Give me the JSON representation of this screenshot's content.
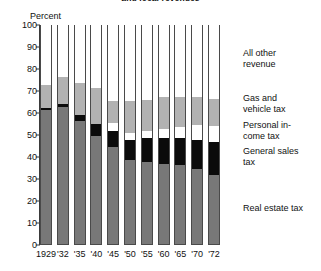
{
  "title_partial": "and local revenues",
  "axis": {
    "ylabel": "Percent",
    "yticks": [
      "100",
      "90",
      "80",
      "70",
      "60",
      "50",
      "40",
      "30",
      "20",
      "10",
      "0"
    ],
    "xticks": [
      "1929",
      "'32",
      "'35",
      "'40",
      "'45",
      "'50",
      "'55",
      "'60",
      "'65",
      "'70",
      "'72"
    ]
  },
  "legend": [
    {
      "key": "other",
      "line1": "All other",
      "line2": "revenue",
      "color": "#ffffff",
      "top": 48
    },
    {
      "key": "gas",
      "line1": "Gas and",
      "line2": "vehicle tax",
      "color": "#b2b2b2",
      "top": 93
    },
    {
      "key": "income",
      "line1": "Personal in-",
      "line2": "come tax",
      "color": "#ffffff",
      "top": 120
    },
    {
      "key": "sales",
      "line1": "General sales",
      "line2": "tax",
      "color": "#0b0b0b",
      "top": 146
    },
    {
      "key": "real",
      "line1": "Real estate tax",
      "line2": "",
      "color": "#787878",
      "top": 203
    }
  ],
  "chart_data": {
    "type": "bar",
    "stacked": true,
    "title": "and local revenues",
    "xlabel": "",
    "ylabel": "Percent",
    "ylim": [
      0,
      100
    ],
    "ytick_step": 10,
    "grid": false,
    "legend_position": "right",
    "categories": [
      "1929",
      "'32",
      "'35",
      "'40",
      "'45",
      "'50",
      "'55",
      "'60",
      "'65",
      "'70",
      "'72"
    ],
    "series": [
      {
        "name": "Real estate tax",
        "color": "#787878",
        "values": [
          61.0,
          62.5,
          56.0,
          49.0,
          44.0,
          38.0,
          37.5,
          36.5,
          36.0,
          34.0,
          31.5
        ]
      },
      {
        "name": "General sales tax",
        "color": "#0b0b0b",
        "values": [
          1.0,
          1.0,
          2.5,
          5.5,
          7.5,
          9.5,
          10.5,
          11.5,
          12.0,
          13.5,
          15.0
        ]
      },
      {
        "name": "Personal income tax",
        "color": "#ffffff",
        "values": [
          0.0,
          0.0,
          0.0,
          0.0,
          3.5,
          3.0,
          3.5,
          4.5,
          5.0,
          6.5,
          7.0
        ]
      },
      {
        "name": "Gas and vehicle tax",
        "color": "#b2b2b2",
        "values": [
          10.5,
          12.5,
          14.5,
          16.5,
          10.0,
          14.5,
          14.0,
          14.5,
          14.0,
          13.0,
          12.5
        ]
      },
      {
        "name": "All other revenue",
        "color": "#ffffff",
        "values": [
          27.5,
          24.0,
          27.0,
          29.0,
          35.0,
          35.0,
          34.5,
          33.0,
          33.0,
          33.0,
          34.0
        ]
      }
    ],
    "cumulative_tops": {
      "1929": {
        "real": 61.0,
        "sales": 62.0,
        "income": 62.0,
        "gas": 72.5,
        "other": 100
      },
      "'32": {
        "real": 62.5,
        "sales": 63.5,
        "income": 63.5,
        "gas": 76.0,
        "other": 100
      },
      "'35": {
        "real": 56.0,
        "sales": 58.5,
        "income": 58.5,
        "gas": 73.0,
        "other": 100
      },
      "'40": {
        "real": 49.0,
        "sales": 54.5,
        "income": 54.5,
        "gas": 71.0,
        "other": 100
      },
      "'45": {
        "real": 44.0,
        "sales": 51.5,
        "income": 55.0,
        "gas": 65.0,
        "other": 100
      },
      "'50": {
        "real": 38.0,
        "sales": 47.5,
        "income": 50.5,
        "gas": 65.0,
        "other": 100
      },
      "'55": {
        "real": 37.5,
        "sales": 48.0,
        "income": 51.5,
        "gas": 65.5,
        "other": 100
      },
      "'60": {
        "real": 36.5,
        "sales": 48.0,
        "income": 52.5,
        "gas": 67.0,
        "other": 100
      },
      "'65": {
        "real": 36.0,
        "sales": 48.0,
        "income": 53.0,
        "gas": 67.0,
        "other": 100
      },
      "'70": {
        "real": 34.0,
        "sales": 47.5,
        "income": 54.0,
        "gas": 67.0,
        "other": 100
      },
      "'72": {
        "real": 31.5,
        "sales": 46.5,
        "income": 53.5,
        "gas": 66.0,
        "other": 100
      }
    }
  }
}
